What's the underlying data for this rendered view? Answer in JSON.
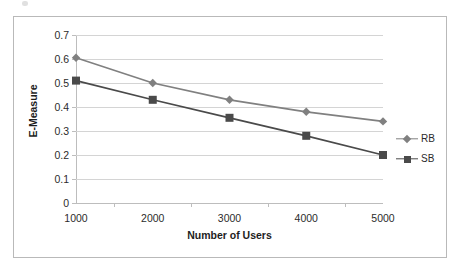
{
  "figure": {
    "alt_name": "line-chart-e-measure-vs-number-of-users"
  },
  "chart_data": {
    "type": "line",
    "title": "",
    "xlabel": "Number of Users",
    "ylabel": "E-Measure",
    "categories": [
      "1000",
      "2000",
      "3000",
      "4000",
      "5000"
    ],
    "x": [
      1000,
      2000,
      3000,
      4000,
      5000
    ],
    "xlim": [
      1000,
      5000
    ],
    "ylim": [
      0,
      0.7
    ],
    "yticks": [
      "0",
      "0.1",
      "0.2",
      "0.3",
      "0.4",
      "0.5",
      "0.6",
      "0.7"
    ],
    "ytick_values": [
      0,
      0.1,
      0.2,
      0.3,
      0.4,
      0.5,
      0.6,
      0.7
    ],
    "grid": "horizontal",
    "legend_position": "right",
    "series": [
      {
        "name": "RB",
        "values": [
          0.605,
          0.5,
          0.43,
          0.38,
          0.34
        ],
        "color": "#808080",
        "marker": "diamond"
      },
      {
        "name": "SB",
        "values": [
          0.51,
          0.43,
          0.355,
          0.28,
          0.2
        ],
        "color": "#4a4a4a",
        "marker": "square"
      }
    ]
  },
  "legend": {
    "items": [
      {
        "label": "RB"
      },
      {
        "label": "SB"
      }
    ]
  },
  "colors": {
    "rb": "#808080",
    "sb": "#4a4a4a",
    "grid": "#d4d4d4",
    "axis": "#bdbdbd",
    "frame": "#b9b9b9",
    "text": "#2b2b2b"
  }
}
